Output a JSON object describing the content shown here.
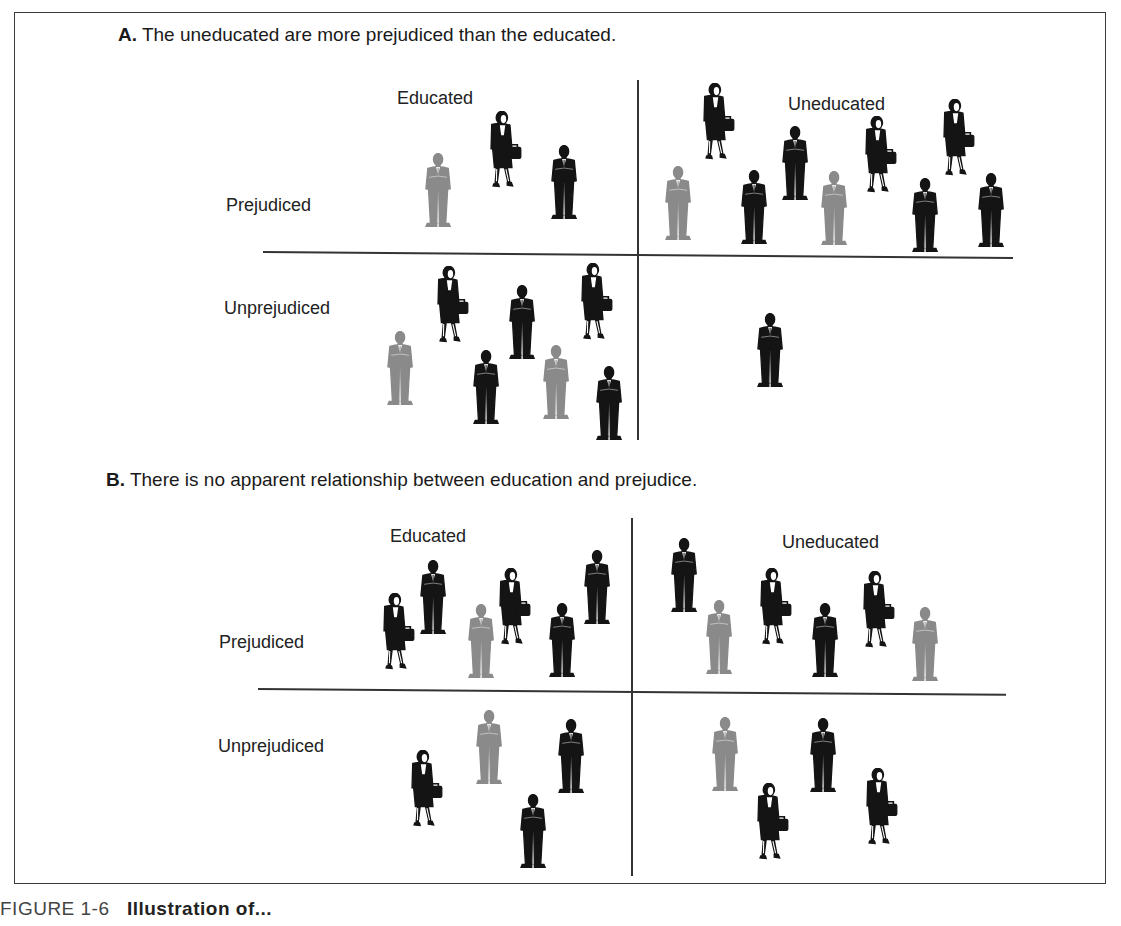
{
  "figure": {
    "caption_prefix": "FIGURE 1-6",
    "caption_title": "Illustration of..."
  },
  "panels": [
    {
      "id": "A",
      "letter": "A.",
      "title": "The uneducated are more prejudiced than the educated.",
      "col_labels": [
        "Educated",
        "Uneducated"
      ],
      "row_labels": [
        "Prejudiced",
        "Unprejudiced"
      ],
      "cells": {
        "educated_prejudiced": 3,
        "uneducated_prejudiced": 9,
        "educated_unprejudiced": 7,
        "uneducated_unprejudiced": 1
      }
    },
    {
      "id": "B",
      "letter": "B.",
      "title": "There is no apparent relationship between education and prejudice.",
      "col_labels": [
        "Educated",
        "Uneducated"
      ],
      "row_labels": [
        "Prejudiced",
        "Unprejudiced"
      ],
      "cells": {
        "educated_prejudiced": 6,
        "uneducated_prejudiced": 6,
        "educated_unprejudiced": 4,
        "uneducated_unprejudiced": 4
      }
    }
  ],
  "people": [
    {
      "panel": "A",
      "cell": "educated_prejudiced",
      "type": "gray-man",
      "x": 438,
      "y": 190
    },
    {
      "panel": "A",
      "cell": "educated_prejudiced",
      "type": "woman",
      "x": 505,
      "y": 150
    },
    {
      "panel": "A",
      "cell": "educated_prejudiced",
      "type": "black-man",
      "x": 564,
      "y": 182
    },
    {
      "panel": "A",
      "cell": "uneducated_prejudiced",
      "type": "gray-man",
      "x": 678,
      "y": 203
    },
    {
      "panel": "A",
      "cell": "uneducated_prejudiced",
      "type": "woman",
      "x": 718,
      "y": 122
    },
    {
      "panel": "A",
      "cell": "uneducated_prejudiced",
      "type": "black-man",
      "x": 754,
      "y": 207
    },
    {
      "panel": "A",
      "cell": "uneducated_prejudiced",
      "type": "black-man",
      "x": 795,
      "y": 163
    },
    {
      "panel": "A",
      "cell": "uneducated_prejudiced",
      "type": "gray-man",
      "x": 834,
      "y": 208
    },
    {
      "panel": "A",
      "cell": "uneducated_prejudiced",
      "type": "woman",
      "x": 880,
      "y": 155
    },
    {
      "panel": "A",
      "cell": "uneducated_prejudiced",
      "type": "black-man",
      "x": 925,
      "y": 215
    },
    {
      "panel": "A",
      "cell": "uneducated_prejudiced",
      "type": "woman",
      "x": 958,
      "y": 138
    },
    {
      "panel": "A",
      "cell": "uneducated_prejudiced",
      "type": "black-man",
      "x": 991,
      "y": 210
    },
    {
      "panel": "A",
      "cell": "educated_unprejudiced",
      "type": "woman",
      "x": 452,
      "y": 305
    },
    {
      "panel": "A",
      "cell": "educated_unprejudiced",
      "type": "black-man",
      "x": 522,
      "y": 322
    },
    {
      "panel": "A",
      "cell": "educated_unprejudiced",
      "type": "woman",
      "x": 596,
      "y": 302
    },
    {
      "panel": "A",
      "cell": "educated_unprejudiced",
      "type": "gray-man",
      "x": 400,
      "y": 368
    },
    {
      "panel": "A",
      "cell": "educated_unprejudiced",
      "type": "black-man",
      "x": 486,
      "y": 387
    },
    {
      "panel": "A",
      "cell": "educated_unprejudiced",
      "type": "gray-man",
      "x": 556,
      "y": 382
    },
    {
      "panel": "A",
      "cell": "educated_unprejudiced",
      "type": "black-man",
      "x": 609,
      "y": 403
    },
    {
      "panel": "A",
      "cell": "uneducated_unprejudiced",
      "type": "black-man",
      "x": 770,
      "y": 350
    },
    {
      "panel": "B",
      "cell": "educated_prejudiced",
      "type": "woman",
      "x": 398,
      "y": 632
    },
    {
      "panel": "B",
      "cell": "educated_prejudiced",
      "type": "black-man",
      "x": 433,
      "y": 597
    },
    {
      "panel": "B",
      "cell": "educated_prejudiced",
      "type": "gray-man",
      "x": 481,
      "y": 641
    },
    {
      "panel": "B",
      "cell": "educated_prejudiced",
      "type": "woman",
      "x": 514,
      "y": 607
    },
    {
      "panel": "B",
      "cell": "educated_prejudiced",
      "type": "black-man",
      "x": 562,
      "y": 640
    },
    {
      "panel": "B",
      "cell": "educated_prejudiced",
      "type": "black-man",
      "x": 597,
      "y": 587
    },
    {
      "panel": "B",
      "cell": "uneducated_prejudiced",
      "type": "black-man",
      "x": 684,
      "y": 575
    },
    {
      "panel": "B",
      "cell": "uneducated_prejudiced",
      "type": "gray-man",
      "x": 719,
      "y": 637
    },
    {
      "panel": "B",
      "cell": "uneducated_prejudiced",
      "type": "woman",
      "x": 775,
      "y": 607
    },
    {
      "panel": "B",
      "cell": "uneducated_prejudiced",
      "type": "black-man",
      "x": 825,
      "y": 640
    },
    {
      "panel": "B",
      "cell": "uneducated_prejudiced",
      "type": "woman",
      "x": 878,
      "y": 610
    },
    {
      "panel": "B",
      "cell": "uneducated_prejudiced",
      "type": "gray-man",
      "x": 925,
      "y": 644
    },
    {
      "panel": "B",
      "cell": "educated_unprejudiced",
      "type": "woman",
      "x": 426,
      "y": 789
    },
    {
      "panel": "B",
      "cell": "educated_unprejudiced",
      "type": "gray-man",
      "x": 489,
      "y": 747
    },
    {
      "panel": "B",
      "cell": "educated_unprejudiced",
      "type": "black-man",
      "x": 571,
      "y": 756
    },
    {
      "panel": "B",
      "cell": "educated_unprejudiced",
      "type": "black-man",
      "x": 533,
      "y": 831
    },
    {
      "panel": "B",
      "cell": "uneducated_unprejudiced",
      "type": "gray-man",
      "x": 725,
      "y": 754
    },
    {
      "panel": "B",
      "cell": "uneducated_unprejudiced",
      "type": "black-man",
      "x": 823,
      "y": 755
    },
    {
      "panel": "B",
      "cell": "uneducated_unprejudiced",
      "type": "woman",
      "x": 772,
      "y": 822
    },
    {
      "panel": "B",
      "cell": "uneducated_unprejudiced",
      "type": "woman",
      "x": 881,
      "y": 807
    }
  ],
  "colors": {
    "black_figure": "#141414",
    "gray_figure": "#8a8a8a",
    "lines": "#333333",
    "text": "#1a1a1a"
  }
}
